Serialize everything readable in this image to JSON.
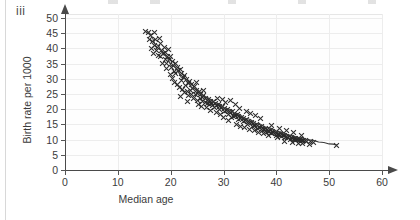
{
  "part_label": "iii",
  "chart_data": {
    "type": "scatter",
    "title": "",
    "xlabel": "Median age",
    "ylabel": "Birth rate per 1000",
    "xlim": [
      0,
      60
    ],
    "ylim": [
      0,
      50
    ],
    "xticks": [
      0,
      10,
      20,
      30,
      40,
      50,
      60
    ],
    "yticks": [
      0,
      5,
      10,
      15,
      20,
      25,
      30,
      35,
      40,
      45,
      50
    ],
    "grid": true,
    "legend": "none",
    "marker": "x",
    "marker_color": "#2b2b2b",
    "trendline": {
      "present": true,
      "description": "smooth decreasing curve through the cloud",
      "points": [
        [
          15.5,
          45.5
        ],
        [
          17,
          41.5
        ],
        [
          18.5,
          38.0
        ],
        [
          20,
          34.5
        ],
        [
          22,
          30.5
        ],
        [
          24,
          27.0
        ],
        [
          26,
          24.3
        ],
        [
          28,
          22.3
        ],
        [
          30,
          20.5
        ],
        [
          32,
          18.7
        ],
        [
          34,
          17.0
        ],
        [
          36,
          15.4
        ],
        [
          38,
          14.0
        ],
        [
          40,
          12.7
        ],
        [
          42,
          11.6
        ],
        [
          44,
          10.7
        ],
        [
          46,
          9.9
        ],
        [
          48,
          9.2
        ],
        [
          50,
          8.6
        ],
        [
          51.5,
          8.2
        ]
      ]
    },
    "points": [
      [
        15.2,
        45.6
      ],
      [
        15.8,
        45.2
      ],
      [
        16.2,
        44.3
      ],
      [
        16.9,
        45.2
      ],
      [
        16.0,
        43.0
      ],
      [
        16.6,
        42.2
      ],
      [
        17.2,
        42.8
      ],
      [
        17.0,
        41.0
      ],
      [
        17.6,
        40.3
      ],
      [
        18.0,
        41.6
      ],
      [
        17.4,
        39.2
      ],
      [
        18.3,
        39.4
      ],
      [
        18.6,
        38.3
      ],
      [
        18.1,
        37.4
      ],
      [
        18.9,
        40.2
      ],
      [
        19.1,
        38.8
      ],
      [
        19.4,
        37.2
      ],
      [
        19.0,
        36.2
      ],
      [
        19.7,
        36.4
      ],
      [
        19.3,
        35.1
      ],
      [
        20.0,
        37.3
      ],
      [
        20.3,
        35.8
      ],
      [
        20.6,
        34.4
      ],
      [
        20.1,
        33.6
      ],
      [
        20.9,
        35.0
      ],
      [
        21.2,
        33.8
      ],
      [
        21.5,
        32.6
      ],
      [
        21.0,
        31.8
      ],
      [
        21.8,
        33.2
      ],
      [
        22.1,
        31.6
      ],
      [
        22.4,
        30.4
      ],
      [
        22.0,
        29.6
      ],
      [
        22.7,
        31.0
      ],
      [
        23.0,
        29.8
      ],
      [
        23.3,
        28.6
      ],
      [
        22.9,
        27.9
      ],
      [
        23.6,
        29.2
      ],
      [
        23.9,
        28.0
      ],
      [
        24.2,
        26.9
      ],
      [
        23.8,
        26.2
      ],
      [
        24.5,
        27.4
      ],
      [
        24.8,
        26.3
      ],
      [
        25.1,
        25.3
      ],
      [
        24.7,
        24.7
      ],
      [
        25.4,
        25.8
      ],
      [
        25.7,
        24.8
      ],
      [
        26.0,
        24.0
      ],
      [
        25.6,
        23.4
      ],
      [
        26.3,
        24.4
      ],
      [
        26.6,
        23.6
      ],
      [
        26.9,
        22.9
      ],
      [
        26.5,
        22.3
      ],
      [
        27.2,
        23.3
      ],
      [
        27.5,
        22.6
      ],
      [
        27.8,
        22.0
      ],
      [
        27.4,
        21.5
      ],
      [
        28.1,
        22.4
      ],
      [
        28.4,
        21.8
      ],
      [
        28.7,
        21.2
      ],
      [
        28.3,
        20.7
      ],
      [
        29.0,
        21.6
      ],
      [
        29.3,
        21.0
      ],
      [
        29.6,
        20.4
      ],
      [
        29.2,
        19.9
      ],
      [
        29.9,
        20.8
      ],
      [
        30.2,
        20.2
      ],
      [
        30.5,
        19.6
      ],
      [
        30.1,
        19.1
      ],
      [
        30.8,
        20.0
      ],
      [
        31.1,
        19.4
      ],
      [
        31.4,
        18.8
      ],
      [
        31.0,
        18.3
      ],
      [
        31.7,
        19.1
      ],
      [
        32.0,
        18.5
      ],
      [
        32.3,
        17.9
      ],
      [
        31.9,
        17.5
      ],
      [
        32.6,
        18.2
      ],
      [
        32.9,
        17.6
      ],
      [
        33.2,
        17.1
      ],
      [
        32.8,
        16.7
      ],
      [
        33.5,
        17.3
      ],
      [
        33.8,
        16.8
      ],
      [
        34.1,
        16.3
      ],
      [
        33.7,
        15.9
      ],
      [
        34.4,
        16.5
      ],
      [
        34.7,
        16.0
      ],
      [
        35.0,
        15.5
      ],
      [
        34.6,
        15.1
      ],
      [
        35.3,
        15.7
      ],
      [
        35.6,
        15.2
      ],
      [
        35.9,
        14.8
      ],
      [
        35.5,
        14.4
      ],
      [
        36.2,
        14.9
      ],
      [
        36.5,
        14.5
      ],
      [
        36.8,
        14.1
      ],
      [
        36.4,
        13.7
      ],
      [
        37.1,
        14.2
      ],
      [
        37.4,
        13.8
      ],
      [
        37.7,
        13.4
      ],
      [
        37.3,
        13.1
      ],
      [
        38.0,
        13.6
      ],
      [
        38.3,
        13.2
      ],
      [
        38.6,
        12.8
      ],
      [
        38.2,
        12.5
      ],
      [
        38.9,
        13.0
      ],
      [
        39.2,
        12.6
      ],
      [
        39.5,
        12.3
      ],
      [
        39.1,
        12.0
      ],
      [
        39.8,
        12.4
      ],
      [
        40.1,
        12.1
      ],
      [
        40.4,
        11.8
      ],
      [
        40.0,
        11.5
      ],
      [
        40.7,
        11.9
      ],
      [
        41.0,
        11.6
      ],
      [
        41.3,
        11.3
      ],
      [
        40.9,
        11.0
      ],
      [
        41.6,
        11.4
      ],
      [
        41.9,
        11.1
      ],
      [
        42.2,
        10.8
      ],
      [
        41.8,
        10.6
      ],
      [
        42.5,
        10.9
      ],
      [
        42.8,
        10.6
      ],
      [
        43.1,
        10.4
      ],
      [
        42.7,
        10.1
      ],
      [
        43.4,
        10.5
      ],
      [
        43.7,
        10.2
      ],
      [
        44.0,
        10.0
      ],
      [
        43.6,
        9.8
      ],
      [
        44.3,
        10.1
      ],
      [
        44.6,
        9.9
      ],
      [
        44.9,
        9.7
      ],
      [
        44.5,
        9.5
      ],
      [
        45.2,
        9.8
      ],
      [
        45.5,
        9.6
      ],
      [
        45.8,
        9.4
      ],
      [
        46.4,
        9.3
      ],
      [
        47.0,
        9.2
      ],
      [
        51.4,
        8.0
      ],
      [
        24.3,
        23.5
      ],
      [
        25.0,
        23.0
      ],
      [
        26.1,
        22.6
      ],
      [
        27.0,
        22.0
      ],
      [
        28.0,
        21.3
      ],
      [
        23.4,
        24.5
      ],
      [
        24.0,
        24.9
      ],
      [
        22.6,
        25.4
      ],
      [
        23.1,
        25.9
      ],
      [
        22.3,
        26.6
      ],
      [
        21.6,
        27.3
      ],
      [
        21.3,
        28.1
      ],
      [
        20.8,
        28.8
      ],
      [
        20.4,
        30.2
      ],
      [
        19.9,
        31.4
      ],
      [
        28.9,
        23.6
      ],
      [
        29.8,
        23.2
      ],
      [
        31.3,
        22.9
      ],
      [
        30.4,
        22.2
      ],
      [
        32.2,
        21.4
      ],
      [
        33.0,
        20.1
      ],
      [
        34.3,
        19.2
      ],
      [
        35.2,
        18.6
      ],
      [
        36.1,
        17.8
      ],
      [
        37.0,
        16.9
      ],
      [
        33.3,
        14.2
      ],
      [
        34.9,
        13.3
      ],
      [
        36.7,
        12.4
      ],
      [
        38.5,
        11.5
      ],
      [
        40.3,
        10.7
      ],
      [
        27.6,
        19.6
      ],
      [
        29.4,
        18.4
      ],
      [
        31.6,
        17.2
      ],
      [
        26.8,
        20.6
      ],
      [
        25.2,
        21.6
      ],
      [
        39.0,
        14.6
      ],
      [
        40.6,
        13.7
      ],
      [
        42.0,
        12.9
      ],
      [
        43.3,
        12.2
      ],
      [
        44.8,
        11.5
      ],
      [
        41.5,
        9.3
      ],
      [
        43.0,
        9.0
      ],
      [
        44.2,
        8.8
      ],
      [
        45.0,
        8.6
      ],
      [
        46.2,
        8.4
      ],
      [
        16.4,
        40.0
      ],
      [
        17.9,
        43.3
      ],
      [
        19.6,
        39.6
      ],
      [
        18.4,
        35.0
      ],
      [
        20.7,
        32.4
      ],
      [
        24.9,
        28.9
      ],
      [
        26.2,
        26.1
      ],
      [
        30.9,
        16.2
      ],
      [
        32.5,
        15.0
      ],
      [
        34.0,
        14.0
      ],
      [
        35.8,
        12.9
      ],
      [
        37.6,
        11.9
      ],
      [
        21.9,
        24.2
      ],
      [
        23.2,
        22.5
      ],
      [
        25.9,
        20.9
      ],
      [
        28.6,
        19.0
      ],
      [
        30.0,
        17.4
      ],
      [
        19.2,
        33.4
      ],
      [
        17.7,
        37.6
      ],
      [
        16.8,
        38.2
      ]
    ]
  }
}
